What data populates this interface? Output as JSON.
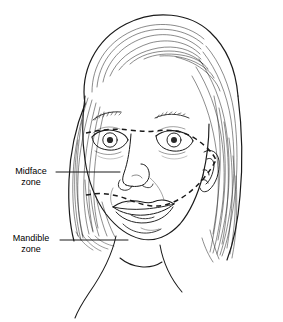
{
  "figure": {
    "kind": "anatomical-line-drawing",
    "background_color": "#ffffff",
    "line_color": "#1a1a1a",
    "width": 283,
    "height": 322
  },
  "annotations": {
    "midface": {
      "line1": "Midface",
      "line2": "zone",
      "leader_from_x": 56,
      "leader_to_x": 120,
      "leader_y": 172
    },
    "mandible": {
      "line1": "Mandible",
      "line2": "zone",
      "leader_from_x": 60,
      "leader_to_x": 128,
      "leader_y": 240
    }
  },
  "zones": [
    {
      "name": "midface-zone-boundary",
      "style": "dashed",
      "dash": "5 4",
      "description": "upper dashed contour running brow-to-brow across the eyes and sweeping down past the right cheek toward the ear"
    },
    {
      "name": "mandible-zone-boundary",
      "style": "dashed",
      "dash": "5 4",
      "description": "lower dashed contour running across the lips and upward to the ear"
    }
  ]
}
